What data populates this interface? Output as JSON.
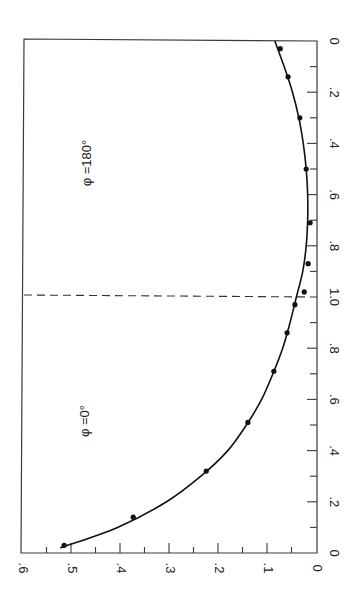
{
  "chart_data": {
    "type": "scatter",
    "orientation": "rotated-90-ccw",
    "title": "",
    "xlabel": "",
    "ylabel": "",
    "ylim": [
      0,
      0.6
    ],
    "xlim_each_branch": [
      0,
      1.0
    ],
    "grid": false,
    "y_ticks": [
      {
        "value": 0,
        "label": "0"
      },
      {
        "value": 0.1,
        "label": ".1"
      },
      {
        "value": 0.2,
        "label": ".2"
      },
      {
        "value": 0.3,
        "label": ".3"
      },
      {
        "value": 0.4,
        "label": ".4"
      },
      {
        "value": 0.5,
        "label": ".5"
      },
      {
        "value": 0.6,
        "label": ".6"
      }
    ],
    "x_ticks_phi180": [
      {
        "value": 0,
        "label": "0"
      },
      {
        "value": 0.2,
        "label": ".2"
      },
      {
        "value": 0.4,
        "label": ".4"
      },
      {
        "value": 0.6,
        "label": ".6"
      },
      {
        "value": 0.8,
        "label": ".8"
      },
      {
        "value": 1.0,
        "label": "1.0"
      }
    ],
    "x_ticks_phi0": [
      {
        "value": 0.8,
        "label": ".8"
      },
      {
        "value": 0.6,
        "label": ".6"
      },
      {
        "value": 0.4,
        "label": ".4"
      },
      {
        "value": 0.2,
        "label": ".2"
      },
      {
        "value": 0,
        "label": "0"
      }
    ],
    "divider": {
      "x": 1.0,
      "style": "dashed"
    },
    "annotations": [
      {
        "text": "φ =180°",
        "branch": "phi180"
      },
      {
        "text": "φ =0°",
        "branch": "phi0"
      }
    ],
    "series": [
      {
        "name": "φ = 180°",
        "points": [
          {
            "x": 0.03,
            "y": 0.073
          },
          {
            "x": 0.14,
            "y": 0.057
          },
          {
            "x": 0.3,
            "y": 0.033
          },
          {
            "x": 0.5,
            "y": 0.02
          },
          {
            "x": 0.71,
            "y": 0.012
          },
          {
            "x": 0.87,
            "y": 0.016
          },
          {
            "x": 0.98,
            "y": 0.024
          }
        ],
        "fit_curve": [
          {
            "x": 0.0,
            "y": 0.084
          },
          {
            "x": 0.1,
            "y": 0.065
          },
          {
            "x": 0.2,
            "y": 0.048
          },
          {
            "x": 0.3,
            "y": 0.035
          },
          {
            "x": 0.4,
            "y": 0.026
          },
          {
            "x": 0.5,
            "y": 0.02
          },
          {
            "x": 0.6,
            "y": 0.017
          },
          {
            "x": 0.7,
            "y": 0.017
          },
          {
            "x": 0.8,
            "y": 0.02
          },
          {
            "x": 0.9,
            "y": 0.027
          },
          {
            "x": 1.0,
            "y": 0.04
          }
        ]
      },
      {
        "name": "φ = 0°",
        "points": [
          {
            "x": 0.97,
            "y": 0.043
          },
          {
            "x": 0.86,
            "y": 0.059
          },
          {
            "x": 0.71,
            "y": 0.086
          },
          {
            "x": 0.51,
            "y": 0.139
          },
          {
            "x": 0.32,
            "y": 0.224
          },
          {
            "x": 0.14,
            "y": 0.373
          },
          {
            "x": 0.03,
            "y": 0.514
          }
        ],
        "fit_curve": [
          {
            "x": 1.0,
            "y": 0.04
          },
          {
            "x": 0.9,
            "y": 0.053
          },
          {
            "x": 0.8,
            "y": 0.068
          },
          {
            "x": 0.7,
            "y": 0.088
          },
          {
            "x": 0.6,
            "y": 0.111
          },
          {
            "x": 0.5,
            "y": 0.142
          },
          {
            "x": 0.4,
            "y": 0.18
          },
          {
            "x": 0.3,
            "y": 0.235
          },
          {
            "x": 0.2,
            "y": 0.305
          },
          {
            "x": 0.1,
            "y": 0.405
          },
          {
            "x": 0.02,
            "y": 0.522
          }
        ]
      }
    ]
  }
}
